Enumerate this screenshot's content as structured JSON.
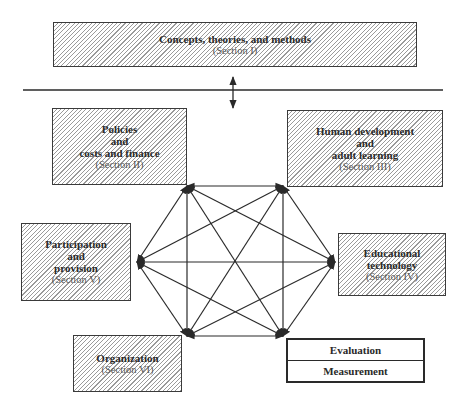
{
  "top": {
    "label": "Concepts, theories, and methods",
    "section": "(Section I)"
  },
  "nodes": {
    "policies": {
      "lines": [
        "Policies",
        "and",
        "costs and finance"
      ],
      "section": "(Section II)"
    },
    "human_dev": {
      "lines": [
        "Human development",
        "and",
        "adult learning"
      ],
      "section": "(Section III)"
    },
    "edtech": {
      "lines": [
        "Educational",
        "technology"
      ],
      "section": "(Section IV)"
    },
    "participation": {
      "lines": [
        "Participation",
        "and",
        "provision"
      ],
      "section": "(Section V)"
    },
    "organization": {
      "lines": [
        "Organization"
      ],
      "section": "(Section VI)"
    }
  },
  "evaluation_box": {
    "top": "Evaluation",
    "bottom": "Measurement"
  },
  "colors": {
    "line": "#2a2a2a",
    "hatch": "#9a9a9a"
  }
}
